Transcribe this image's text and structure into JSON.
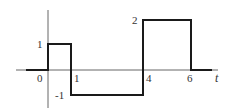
{
  "diagram": {
    "type": "piecewise-signal",
    "axis_variable": "t",
    "x_tick_labels": [
      "0",
      "1",
      "4",
      "6"
    ],
    "y_level_labels": [
      "1",
      "-1",
      "2"
    ],
    "segments": [
      {
        "from": -1,
        "to": 0,
        "value": 0
      },
      {
        "from": 0,
        "to": 1,
        "value": 1
      },
      {
        "from": 1,
        "to": 4,
        "value": -1
      },
      {
        "from": 4,
        "to": 6,
        "value": 2
      },
      {
        "from": 6,
        "to": 7,
        "value": 0
      }
    ],
    "colors": {
      "signal": "#1a1a1a",
      "axis": "#555555",
      "labels": "#333333"
    }
  }
}
